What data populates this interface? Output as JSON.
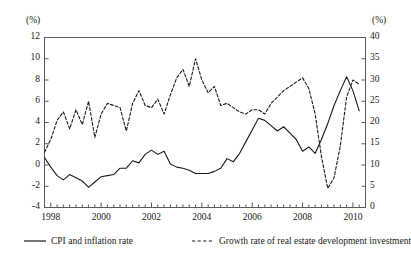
{
  "chart_data": {
    "type": "line",
    "title": "",
    "xlabel": "",
    "grid": false,
    "legend_position": "bottom",
    "x_start": 1997.75,
    "x_end": 2010.5,
    "x_tick_labels": [
      "1998",
      "2000",
      "2002",
      "2004",
      "2006",
      "2008",
      "2010"
    ],
    "x_tick_values": [
      1998,
      2000,
      2002,
      2004,
      2006,
      2008,
      2010
    ],
    "x_minor_tick_step": 0.25,
    "axes": [
      {
        "id": "left",
        "unit": "(%)",
        "label": "CPI and inflation rate",
        "ylim": [
          -4,
          12
        ],
        "ytick_labels": [
          "12",
          "10",
          "8",
          "6",
          "4",
          "2",
          "0",
          "-2",
          "-4"
        ],
        "ytick_values": [
          12,
          10,
          8,
          6,
          4,
          2,
          0,
          -2,
          -4
        ]
      },
      {
        "id": "right",
        "unit": "(%)",
        "label": "Growth rate of real estate development investment",
        "ylim": [
          0,
          40
        ],
        "ytick_labels": [
          "40",
          "35",
          "30",
          "25",
          "20",
          "15",
          "10",
          "5",
          "0"
        ],
        "ytick_values": [
          40,
          35,
          30,
          25,
          20,
          15,
          10,
          5,
          0
        ]
      }
    ],
    "series": [
      {
        "name": "CPI and inflation rate",
        "axis": "left",
        "style": "solid",
        "color": "#1a1a1a",
        "x": [
          1997.75,
          1998.0,
          1998.25,
          1998.5,
          1998.75,
          1999.0,
          1999.25,
          1999.5,
          1999.75,
          2000.0,
          2000.25,
          2000.5,
          2000.75,
          2001.0,
          2001.25,
          2001.5,
          2001.75,
          2002.0,
          2002.25,
          2002.5,
          2002.75,
          2003.0,
          2003.25,
          2003.5,
          2003.75,
          2004.0,
          2004.25,
          2004.5,
          2004.75,
          2005.0,
          2005.25,
          2005.5,
          2005.75,
          2006.0,
          2006.25,
          2006.5,
          2006.75,
          2007.0,
          2007.25,
          2007.5,
          2007.75,
          2008.0,
          2008.25,
          2008.5,
          2008.75,
          2009.0,
          2009.25,
          2009.5,
          2009.75,
          2010.0,
          2010.25
        ],
        "y": [
          0.7,
          -0.2,
          -1.0,
          -1.4,
          -0.9,
          -1.2,
          -1.5,
          -2.1,
          -1.6,
          -1.1,
          -1.0,
          -0.9,
          -0.3,
          -0.3,
          0.4,
          0.2,
          1.0,
          1.4,
          1.0,
          1.3,
          0.1,
          -0.2,
          -0.3,
          -0.5,
          -0.8,
          -0.8,
          -0.8,
          -0.6,
          -0.3,
          0.6,
          0.3,
          1.1,
          2.2,
          3.3,
          4.4,
          4.2,
          3.7,
          3.2,
          3.6,
          3.0,
          2.4,
          1.3,
          1.7,
          1.1,
          2.4,
          3.9,
          5.6,
          7.0,
          8.3,
          7.0,
          5.1
        ],
        "note": "values plotted on left axis in percent"
      },
      {
        "name": "Growth rate of real estate development investment",
        "axis": "right",
        "style": "dashed",
        "color": "#1a1a1a",
        "x": [
          1997.75,
          1998.0,
          1998.25,
          1998.5,
          1998.75,
          1999.0,
          1999.25,
          1999.5,
          1999.75,
          2000.0,
          2000.25,
          2000.5,
          2000.75,
          2001.0,
          2001.25,
          2001.5,
          2001.75,
          2002.0,
          2002.25,
          2002.5,
          2002.75,
          2003.0,
          2003.25,
          2003.5,
          2003.75,
          2004.0,
          2004.25,
          2004.5,
          2004.75,
          2005.0,
          2005.25,
          2005.5,
          2005.75,
          2006.0,
          2006.25,
          2006.5,
          2006.75,
          2007.0,
          2007.25,
          2007.5,
          2007.75,
          2008.0,
          2008.25,
          2008.5,
          2008.75,
          2009.0,
          2009.25,
          2009.5,
          2009.75,
          2010.0,
          2010.25
        ],
        "y": [
          13.0,
          16.0,
          20.5,
          22.5,
          18.5,
          23.0,
          19.5,
          25.0,
          16.5,
          22.0,
          24.5,
          24.0,
          23.5,
          18.0,
          24.5,
          27.5,
          24.0,
          23.5,
          25.5,
          22.0,
          26.5,
          30.5,
          32.5,
          28.5,
          35.0,
          30.0,
          27.0,
          28.5,
          24.0,
          24.5,
          23.5,
          22.5,
          22.0,
          23.0,
          23.0,
          22.0,
          24.5,
          26.0,
          27.5,
          28.5,
          29.5,
          30.5,
          28.0,
          22.0,
          12.0,
          4.5,
          7.0,
          14.5,
          26.0,
          30.0,
          29.0
        ],
        "note": "values plotted on right axis in percent"
      }
    ]
  },
  "legend": {
    "entries": [
      {
        "label": "CPI and inflation rate",
        "style": "solid"
      },
      {
        "label": "Growth rate of real estate development investment",
        "style": "dashed"
      }
    ]
  }
}
